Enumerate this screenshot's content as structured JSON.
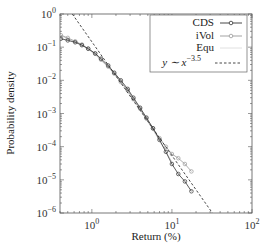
{
  "chart_data": {
    "type": "line",
    "title": "",
    "xlabel": "Return (%)",
    "ylabel": "Probability density",
    "xscale": "log",
    "yscale": "log",
    "xlim": [
      0.4,
      100
    ],
    "ylim": [
      1e-06,
      1
    ],
    "x_ticks": [
      {
        "value": 1,
        "base": "10",
        "exp": "0"
      },
      {
        "value": 10,
        "base": "10",
        "exp": "1"
      },
      {
        "value": 100,
        "base": "10",
        "exp": "2"
      }
    ],
    "y_ticks": [
      {
        "value": 1,
        "base": "10",
        "exp": "0"
      },
      {
        "value": 0.1,
        "base": "10",
        "exp": "−1"
      },
      {
        "value": 0.01,
        "base": "10",
        "exp": "−2"
      },
      {
        "value": 0.001,
        "base": "10",
        "exp": "−3"
      },
      {
        "value": 0.0001,
        "base": "10",
        "exp": "−4"
      },
      {
        "value": 1e-05,
        "base": "10",
        "exp": "−5"
      },
      {
        "value": 1e-06,
        "base": "10",
        "exp": "−6"
      }
    ],
    "grid": false,
    "legend_position": "upper right",
    "series": [
      {
        "name": "CDS",
        "color": "#333333",
        "marker": "circle",
        "x": [
          0.41,
          0.5,
          0.62,
          0.75,
          0.9,
          1.1,
          1.3,
          1.6,
          1.9,
          2.3,
          2.8,
          3.3,
          4.0,
          4.8,
          5.8,
          7.0,
          8.4,
          10.0,
          12.0,
          14.5,
          17.5
        ],
        "y": [
          0.18,
          0.16,
          0.14,
          0.115,
          0.09,
          0.065,
          0.045,
          0.028,
          0.017,
          0.01,
          0.0055,
          0.003,
          0.0015,
          0.00075,
          0.00036,
          0.00016,
          7e-05,
          3e-05,
          1.5e-05,
          9e-06,
          4.5e-06
        ]
      },
      {
        "name": "iVol",
        "color": "#999999",
        "marker": "circle",
        "x": [
          0.41,
          0.5,
          0.62,
          0.75,
          0.9,
          1.1,
          1.3,
          1.6,
          1.9,
          2.3,
          2.8,
          3.3,
          4.0,
          4.8,
          5.8,
          7.0,
          8.4,
          10.0,
          12.0,
          14.5,
          17.5
        ],
        "y": [
          0.23,
          0.19,
          0.15,
          0.12,
          0.09,
          0.063,
          0.042,
          0.026,
          0.016,
          0.009,
          0.005,
          0.0027,
          0.0014,
          0.0007,
          0.00035,
          0.00018,
          0.0001,
          6e-05,
          4.5e-05,
          3e-05,
          1.8e-05
        ]
      },
      {
        "name": "Equ",
        "color": "#cccccc",
        "marker": "none",
        "x": [
          0.41,
          0.5,
          0.62,
          0.75,
          0.9,
          1.1,
          1.3,
          1.6,
          1.9,
          2.3,
          2.8,
          3.3,
          4.0,
          4.8,
          5.8,
          7.0,
          8.4,
          10.0
        ],
        "y": [
          0.22,
          0.18,
          0.145,
          0.115,
          0.087,
          0.06,
          0.04,
          0.025,
          0.0155,
          0.0088,
          0.0048,
          0.0026,
          0.0013,
          0.00065,
          0.00032,
          0.00015,
          7e-05,
          3.5e-05
        ]
      },
      {
        "name": "y ~ x^-3.5",
        "color": "#333333",
        "style": "dashed",
        "x": [
          0.57,
          32
        ],
        "y": [
          1.0,
          1e-06
        ]
      }
    ]
  },
  "legend": {
    "items": [
      {
        "label": "CDS",
        "style": "line-circle-dark"
      },
      {
        "label": "iVol",
        "style": "line-circle-gray"
      },
      {
        "label": "Equ",
        "style": "line-light"
      },
      {
        "label_prefix": "y ∼ x",
        "label_exp": "−3.5",
        "style": "dashed"
      }
    ]
  },
  "axes": {
    "xlabel": "Return (%)",
    "ylabel": "Probability density"
  }
}
